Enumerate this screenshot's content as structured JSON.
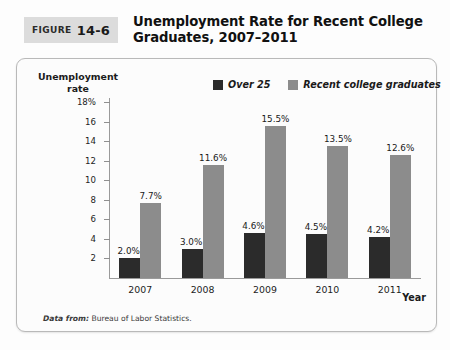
{
  "figure": {
    "badge_word": "FIGURE",
    "badge_number": "14-6",
    "title": "Unemployment Rate for Recent College Graduates, 2007–2011"
  },
  "source_note": {
    "prefix": "Data from:",
    "text": "Bureau of Labor Statistics."
  },
  "colors": {
    "series_over25": "#2b2b2b",
    "series_recent_grads": "#8c8c8c",
    "axis": "#9a9a9a",
    "panel_border": "#b9b9b9",
    "badge_background": "#dcdcdc"
  },
  "chart_data": {
    "type": "bar",
    "title": "Unemployment Rate for Recent College Graduates, 2007–2011",
    "xlabel": "Year",
    "ylabel": "Unemployment rate",
    "categories": [
      "2007",
      "2008",
      "2009",
      "2010",
      "2011"
    ],
    "series": [
      {
        "name": "Over 25",
        "color": "#2b2b2b",
        "values": [
          2.0,
          3.0,
          4.6,
          4.5,
          4.2
        ],
        "labels": [
          "2.0%",
          "3.0%",
          "4.6%",
          "4.5%",
          "4.2%"
        ]
      },
      {
        "name": "Recent college graduates",
        "color": "#8c8c8c",
        "values": [
          7.7,
          11.6,
          15.5,
          13.5,
          12.6
        ],
        "labels": [
          "7.7%",
          "11.6%",
          "15.5%",
          "13.5%",
          "12.6%"
        ]
      }
    ],
    "ylim": [
      0,
      18
    ],
    "ytick_values": [
      18,
      16,
      14,
      12,
      10,
      8,
      6,
      4,
      2
    ],
    "ytick_labels": [
      "18%",
      "16",
      "14",
      "12",
      "10",
      "8",
      "6",
      "4",
      "2"
    ],
    "grid": false,
    "legend_position": "top-center"
  }
}
